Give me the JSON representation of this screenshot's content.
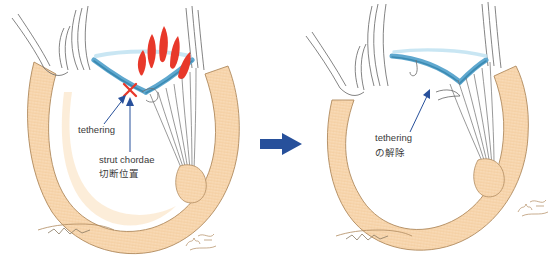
{
  "figure": {
    "panel_left": {
      "name": "before",
      "labels": {
        "tethering": "tethering",
        "strut_chordae": "strut chordae",
        "cut_position_jp": "切断位置"
      },
      "markers": {
        "cut_mark": "red-x",
        "regurgitation_jets": 5
      }
    },
    "panel_right": {
      "name": "after",
      "labels": {
        "tethering": "tethering",
        "release_jp": "の解除"
      },
      "markers": {
        "regurgitation_jets": 0
      }
    },
    "transition_arrow": {
      "direction": "right",
      "color": "#27509b"
    },
    "signature": "artist-signature",
    "bottom_cropped_text": "",
    "colors": {
      "myocardium": "#f7d6ad",
      "myocardium_shadow": "#fbead2",
      "outline": "#8a7a62",
      "leaflet_blue": "#5fa8cf",
      "leaflet_blue_dark": "#2f80a8",
      "leaflet_blue_light": "#bfe2f1",
      "jet_red": "#e8382a",
      "arrow_navy": "#27509b",
      "chordae_grey": "#6d6d6d",
      "atrium_outline": "#6e6e6e",
      "text": "#3a3a3a"
    }
  }
}
